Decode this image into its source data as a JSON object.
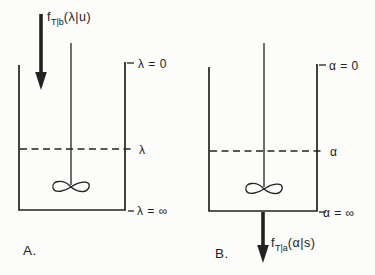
{
  "colors": {
    "ink": "#222222",
    "background": "#fcfcfb"
  },
  "panel_a": {
    "panel_label": "A.",
    "inlet_distribution": {
      "symbol": "f",
      "subscript": "T|b",
      "argument": "(λ|u)"
    },
    "level_marks": {
      "top": "λ = 0",
      "middle": "λ",
      "bottom": "λ = ∞"
    }
  },
  "panel_b": {
    "panel_label": "B.",
    "outlet_distribution": {
      "symbol": "f",
      "subscript": "T|a",
      "argument": "(α|s)"
    },
    "level_marks": {
      "top": "α = 0",
      "middle": "α",
      "bottom": "α = ∞"
    }
  }
}
